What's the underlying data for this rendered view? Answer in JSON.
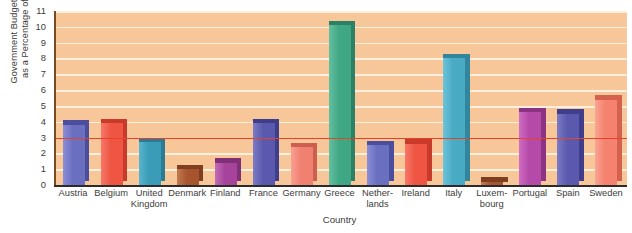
{
  "chart_data": {
    "type": "bar",
    "title": "",
    "xlabel": "Country",
    "ylabel": "Government Budget Deficit as a Percentage of GDP",
    "ylabel_lines": [
      "Government Budget Deficit",
      "as a Percentage of GDP"
    ],
    "ylim": [
      0,
      11
    ],
    "ytick_labels": [
      "0",
      "1",
      "2",
      "3",
      "4",
      "5",
      "6",
      "7",
      "8",
      "9",
      "10",
      "11"
    ],
    "yticks": [
      0,
      1,
      2,
      3,
      4,
      5,
      6,
      7,
      8,
      9,
      10,
      11
    ],
    "grid": true,
    "grid_color": "#fdf0df",
    "plot_background": "#f7c79a",
    "legend": null,
    "reference_line": {
      "value": 3,
      "color": "#e8412a",
      "label": ""
    },
    "categories": [
      "Austria",
      "Belgium",
      "United Kingdom",
      "Denmark",
      "Finland",
      "France",
      "Germany",
      "Greece",
      "Netherlands",
      "Ireland",
      "Italy",
      "Luxembourg",
      "Portugal",
      "Spain",
      "Sweden"
    ],
    "category_label_lines": [
      [
        "Austria"
      ],
      [
        "Belgium"
      ],
      [
        "United",
        "Kingdom"
      ],
      [
        "Denmark"
      ],
      [
        "Finland"
      ],
      [
        "France"
      ],
      [
        "Germany"
      ],
      [
        "Greece"
      ],
      [
        "Nether-",
        "lands"
      ],
      [
        "Ireland"
      ],
      [
        "Italy"
      ],
      [
        "Luxem-",
        "bourg"
      ],
      [
        "Portugal"
      ],
      [
        "Spain"
      ],
      [
        "Sweden"
      ]
    ],
    "values": [
      3.8,
      3.9,
      2.7,
      1.0,
      1.4,
      3.9,
      2.4,
      10.1,
      2.5,
      2.6,
      8.0,
      0.2,
      4.6,
      4.5,
      5.4
    ],
    "colors": [
      "#6b6fc0",
      "#ee5543",
      "#3a9cb8",
      "#a7552e",
      "#a6449c",
      "#5a59ae",
      "#f08070",
      "#3fa783",
      "#6b6fc0",
      "#ee5543",
      "#49aac4",
      "#a7552e",
      "#b54aa8",
      "#5a59ae",
      "#f4826e"
    ],
    "colors_dark": [
      "#4b4e9c",
      "#c93a2b",
      "#2a7b94",
      "#7f3e1f",
      "#7f3077",
      "#3f3e8c",
      "#cc5f4f",
      "#2c8063",
      "#4b4e9c",
      "#c93a2b",
      "#31869e",
      "#7f3e1f",
      "#8d3383",
      "#3f3e8c",
      "#d4604e"
    ],
    "colors_light": [
      "#8a8ed6",
      "#f7776a",
      "#58b5cd",
      "#c37a52",
      "#c36bb8",
      "#7c7bc6",
      "#f9a093",
      "#63c0a0",
      "#8a8ed6",
      "#f7776a",
      "#6cc4da",
      "#c37a52",
      "#cf6cc4",
      "#7c7bc6",
      "#f9a494"
    ]
  }
}
